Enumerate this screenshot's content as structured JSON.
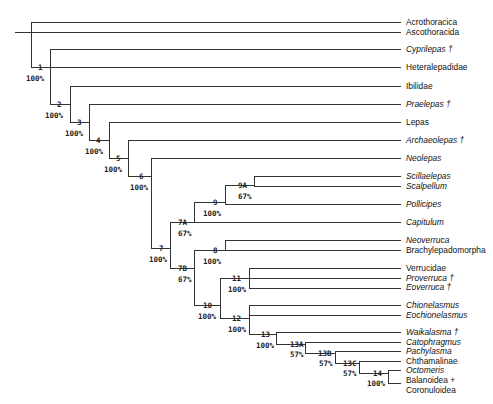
{
  "diagram": {
    "type": "cladogram",
    "taxa": [
      {
        "name": "Acrothoracica",
        "italic": false,
        "extinct": false,
        "y": 22
      },
      {
        "name": "Ascothoracida",
        "italic": false,
        "extinct": false,
        "y": 32
      },
      {
        "name": "Cyprilepas †",
        "italic": true,
        "extinct": true,
        "y": 49
      },
      {
        "name": "Heteralepadidae",
        "italic": false,
        "extinct": false,
        "y": 67
      },
      {
        "name": "Ibilidae",
        "italic": false,
        "extinct": false,
        "y": 86
      },
      {
        "name": "Praelepas †",
        "italic": true,
        "extinct": true,
        "y": 104
      },
      {
        "name": "Lepas",
        "italic": false,
        "extinct": false,
        "y": 122
      },
      {
        "name": "Archaeolepas †",
        "italic": true,
        "extinct": true,
        "y": 140
      },
      {
        "name": "Neolepas",
        "italic": true,
        "extinct": false,
        "y": 158
      },
      {
        "name": "Scillaelepas",
        "italic": true,
        "extinct": false,
        "y": 176
      },
      {
        "name": "Scalpellum",
        "italic": true,
        "extinct": false,
        "y": 186
      },
      {
        "name": "Pollicipes",
        "italic": true,
        "extinct": false,
        "y": 204
      },
      {
        "name": "Capitulum",
        "italic": true,
        "extinct": false,
        "y": 222
      },
      {
        "name": "Neoverruca",
        "italic": true,
        "extinct": false,
        "y": 240
      },
      {
        "name": "Brachylepadomorpha",
        "italic": false,
        "extinct": false,
        "y": 250
      },
      {
        "name": "Verrucidae",
        "italic": false,
        "extinct": false,
        "y": 268
      },
      {
        "name": "Proverruca †",
        "italic": true,
        "extinct": true,
        "y": 278
      },
      {
        "name": "Eoverruca †",
        "italic": true,
        "extinct": true,
        "y": 287
      },
      {
        "name": "Chionelasmus",
        "italic": true,
        "extinct": false,
        "y": 305
      },
      {
        "name": "Eochionelasmus",
        "italic": true,
        "extinct": false,
        "y": 315
      },
      {
        "name": "Waikalasma †",
        "italic": true,
        "extinct": true,
        "y": 332
      },
      {
        "name": "Catophragmus",
        "italic": true,
        "extinct": false,
        "y": 342
      },
      {
        "name": "Pachylasma",
        "italic": true,
        "extinct": false,
        "y": 351
      },
      {
        "name": "Chthamalinae",
        "italic": false,
        "extinct": false,
        "y": 361
      },
      {
        "name": "Octomeris",
        "italic": true,
        "extinct": false,
        "y": 370
      },
      {
        "name": "Balanoidea +",
        "italic": false,
        "extinct": false,
        "y": 380
      },
      {
        "name": "Coronuloidea",
        "italic": false,
        "extinct": false,
        "y": 390
      }
    ],
    "nodes": [
      {
        "id": "1",
        "support": "100%"
      },
      {
        "id": "2",
        "support": "100%"
      },
      {
        "id": "3",
        "support": "100%"
      },
      {
        "id": "4",
        "support": "100%"
      },
      {
        "id": "5",
        "support": "100%"
      },
      {
        "id": "6",
        "support": "100%"
      },
      {
        "id": "7",
        "support": "100%"
      },
      {
        "id": "7A",
        "support": "67%"
      },
      {
        "id": "7B",
        "support": "67%"
      },
      {
        "id": "8",
        "support": "100%"
      },
      {
        "id": "9",
        "support": "100%"
      },
      {
        "id": "9A",
        "support": "67%"
      },
      {
        "id": "10",
        "support": "100%"
      },
      {
        "id": "11",
        "support": "100%"
      },
      {
        "id": "12",
        "support": "100%"
      },
      {
        "id": "13",
        "support": "100%"
      },
      {
        "id": "13A",
        "support": "57%"
      },
      {
        "id": "13B",
        "support": "57%"
      },
      {
        "id": "13C",
        "support": "57%"
      },
      {
        "id": "14",
        "support": "100%"
      }
    ]
  }
}
